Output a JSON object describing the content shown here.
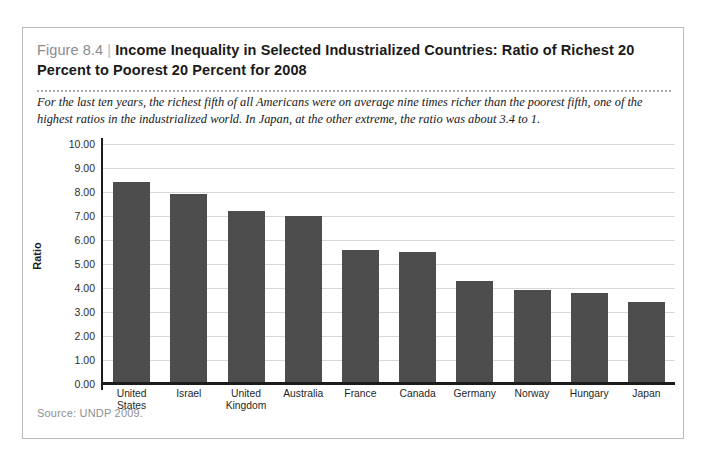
{
  "page_bleed": {
    "left_fragment": "",
    "right_fragment": ""
  },
  "figure": {
    "number": "Figure 8.4",
    "divider": "|",
    "title": "Income Inequality in Selected Industrialized Countries: Ratio of Richest 20 Percent to Poorest 20 Percent for 2008",
    "caption": "For the last ten years, the richest fifth of all Americans were on average nine times richer than the poorest fifth, one of the highest ratios in the industrialized world. In Japan, at the other extreme, the ratio was about 3.4 to 1.",
    "source": "Source: UNDP 2009."
  },
  "colors": {
    "bar": "#4d4d4d",
    "axis": "#1c1c1c",
    "grid": "#d8d8da",
    "frame": "#b9b9bc",
    "figure_number": "#8b8b8f"
  },
  "chart_data": {
    "type": "bar",
    "title": "Income Inequality in Selected Industrialized Countries: Ratio of Richest 20 Percent to Poorest 20 Percent for 2008",
    "xlabel": "",
    "ylabel": "Ratio",
    "categories": [
      "United States",
      "Israel",
      "United Kingdom",
      "Australia",
      "France",
      "Canada",
      "Germany",
      "Norway",
      "Hungary",
      "Japan"
    ],
    "values": [
      8.4,
      7.9,
      7.2,
      7.0,
      5.6,
      5.5,
      4.3,
      3.9,
      3.8,
      3.4
    ],
    "ylim": [
      0,
      10
    ],
    "ytick_step": 1,
    "yticks": [
      "10.00",
      "9.00",
      "8.00",
      "7.00",
      "6.00",
      "5.00",
      "4.00",
      "3.00",
      "2.00",
      "1.00",
      "0.00"
    ],
    "grid": "horizontal",
    "legend": "none"
  }
}
